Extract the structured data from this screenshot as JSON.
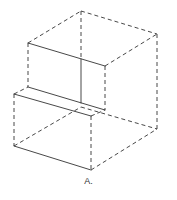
{
  "figure": {
    "caption": "A.",
    "stroke_color": "#333333",
    "background": "#ffffff"
  },
  "edges": {
    "solid": [
      [
        28,
        43,
        105,
        66
      ],
      [
        81,
        59,
        81,
        103
      ],
      [
        28,
        87,
        105,
        110
      ],
      [
        14,
        94,
        91,
        116
      ],
      [
        14,
        146,
        91,
        170
      ]
    ],
    "dashed": [
      [
        81,
        11,
        157,
        34
      ],
      [
        28,
        43,
        81,
        11
      ],
      [
        81,
        11,
        81,
        59
      ],
      [
        157,
        34,
        157,
        129
      ],
      [
        105,
        66,
        157,
        34
      ],
      [
        105,
        66,
        105,
        110
      ],
      [
        28,
        43,
        28,
        87
      ],
      [
        14,
        94,
        28,
        87
      ],
      [
        14,
        94,
        14,
        146
      ],
      [
        91,
        116,
        91,
        170
      ],
      [
        91,
        170,
        157,
        129
      ],
      [
        14,
        146,
        81,
        107
      ],
      [
        81,
        107,
        157,
        129
      ],
      [
        91,
        116,
        105,
        110
      ]
    ]
  }
}
